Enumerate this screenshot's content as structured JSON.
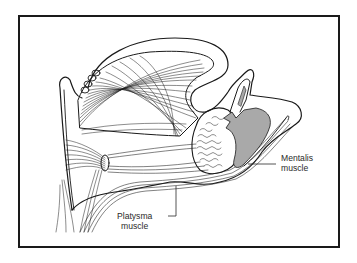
{
  "figure": {
    "labels": {
      "mentalis": {
        "line1": "Mentalis",
        "line2": "muscle"
      },
      "platysma": {
        "line1": "Platysma",
        "line2": "muscle"
      }
    },
    "colors": {
      "stroke": "#1a1a1a",
      "muscle_fill": "#a9a9a9",
      "frame": "#1a1a1a",
      "background": "#ffffff"
    }
  }
}
